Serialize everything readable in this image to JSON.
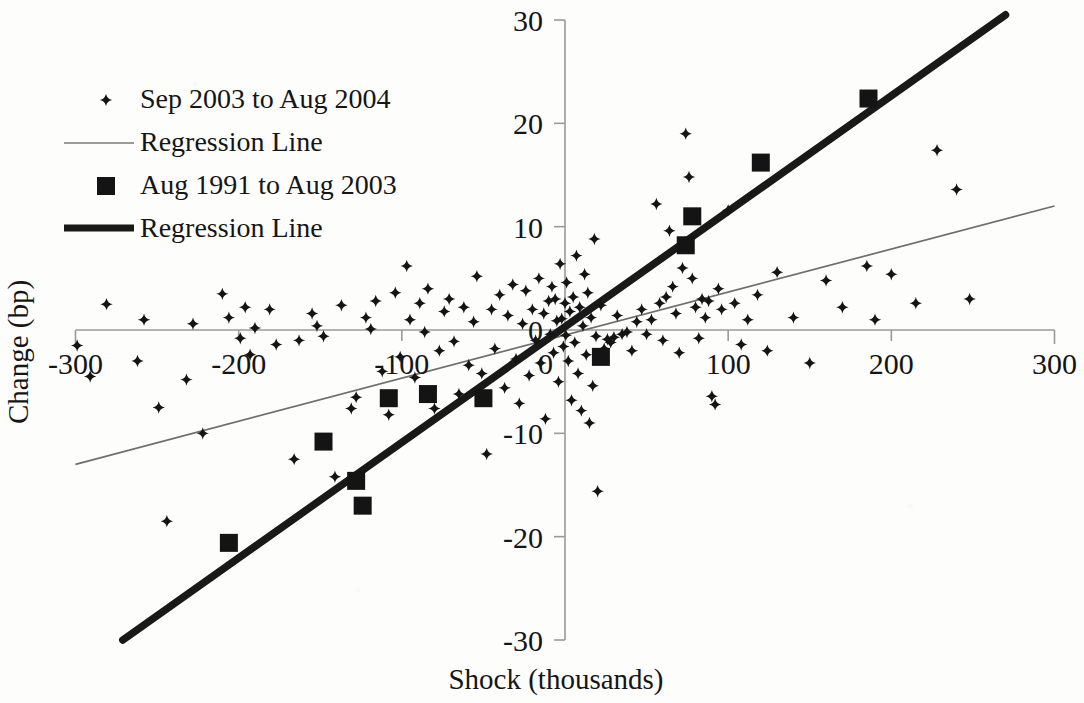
{
  "chart_data": {
    "type": "scatter",
    "title": "",
    "xlabel": "Shock (thousands)",
    "ylabel": "Change (bp)",
    "xlim": [
      -300,
      300
    ],
    "ylim": [
      -30,
      30
    ],
    "xticks": [
      -300,
      -200,
      -100,
      0,
      100,
      200,
      300
    ],
    "yticks": [
      -30,
      -20,
      -10,
      0,
      10,
      20,
      30
    ],
    "xtick_labels": [
      "-300",
      "-200",
      "-100",
      "0",
      "100",
      "200",
      "300"
    ],
    "ytick_labels": [
      "-30",
      "-20",
      "-10",
      "0",
      "10",
      "20",
      "30"
    ],
    "grid": false,
    "legend_position": "upper-left",
    "axis_style": "crossing-at-origin",
    "legend": [
      {
        "label": "Sep 2003 to Aug 2004",
        "marker": "small-cross",
        "kind": "points"
      },
      {
        "label": "Regression Line",
        "marker": "thin-line",
        "kind": "line"
      },
      {
        "label": "Aug 1991 to Aug 2003",
        "marker": "large-square",
        "kind": "points"
      },
      {
        "label": "Regression Line",
        "marker": "thick-line",
        "kind": "line"
      }
    ],
    "colors": {
      "marker": "#141414",
      "thin_line": "#6e6e6e",
      "thick_line": "#191919",
      "axis": "#9a9a9a",
      "background": "#fdfdfc"
    },
    "series": [
      {
        "name": "Sep 2003 to Aug 2004",
        "marker": "small-cross",
        "points": [
          [
            -299,
            -1.5
          ],
          [
            -291,
            -4.5
          ],
          [
            -281,
            2.5
          ],
          [
            -262,
            -3.0
          ],
          [
            -258,
            1.0
          ],
          [
            -249,
            -7.5
          ],
          [
            -244,
            -18.5
          ],
          [
            -232,
            -4.8
          ],
          [
            -228,
            0.6
          ],
          [
            -222,
            -10.0
          ],
          [
            -210,
            3.5
          ],
          [
            -206,
            1.2
          ],
          [
            -199,
            -0.8
          ],
          [
            -196,
            2.2
          ],
          [
            -193,
            -2.4
          ],
          [
            -190,
            0.2
          ],
          [
            -181,
            2.0
          ],
          [
            -177,
            -1.4
          ],
          [
            -166,
            -12.5
          ],
          [
            -163,
            -1.0
          ],
          [
            -155,
            1.6
          ],
          [
            -152,
            0.4
          ],
          [
            -148,
            -0.6
          ],
          [
            -141,
            -14.2
          ],
          [
            -137,
            2.4
          ],
          [
            -131,
            -7.6
          ],
          [
            -128,
            -6.5
          ],
          [
            -122,
            1.2
          ],
          [
            -119,
            0.1
          ],
          [
            -116,
            2.8
          ],
          [
            -112,
            -4.0
          ],
          [
            -108,
            -8.2
          ],
          [
            -104,
            3.6
          ],
          [
            -101,
            -2.6
          ],
          [
            -97,
            6.2
          ],
          [
            -95,
            1.0
          ],
          [
            -92,
            -4.6
          ],
          [
            -89,
            2.6
          ],
          [
            -86,
            -0.2
          ],
          [
            -84,
            4.0
          ],
          [
            -80,
            -7.6
          ],
          [
            -77,
            -2.0
          ],
          [
            -74,
            1.8
          ],
          [
            -71,
            3.0
          ],
          [
            -68,
            -1.1
          ],
          [
            -65,
            -6.2
          ],
          [
            -62,
            2.2
          ],
          [
            -59,
            -3.4
          ],
          [
            -56,
            0.8
          ],
          [
            -54,
            5.2
          ],
          [
            -51,
            -4.2
          ],
          [
            -48,
            -12.0
          ],
          [
            -45,
            2.0
          ],
          [
            -43,
            -1.8
          ],
          [
            -40,
            3.4
          ],
          [
            -37,
            -5.6
          ],
          [
            -35,
            1.4
          ],
          [
            -32,
            4.4
          ],
          [
            -30,
            -2.8
          ],
          [
            -28,
            -7.1
          ],
          [
            -26,
            0.6
          ],
          [
            -24,
            3.8
          ],
          [
            -22,
            -4.4
          ],
          [
            -20,
            2.0
          ],
          [
            -18,
            -1.0
          ],
          [
            -16,
            5.0
          ],
          [
            -15,
            -3.2
          ],
          [
            -13,
            1.6
          ],
          [
            -12,
            -8.6
          ],
          [
            -10,
            2.8
          ],
          [
            -9,
            -0.4
          ],
          [
            -8,
            4.2
          ],
          [
            -7,
            -2.2
          ],
          [
            -6,
            3.0
          ],
          [
            -5,
            0.9
          ],
          [
            -4,
            -5.0
          ],
          [
            -3,
            6.4
          ],
          [
            -2,
            1.1
          ],
          [
            -1,
            -1.6
          ],
          [
            0,
            2.6
          ],
          [
            0.5,
            -0.5
          ],
          [
            1,
            4.6
          ],
          [
            2,
            -3.0
          ],
          [
            3,
            1.8
          ],
          [
            4,
            -6.8
          ],
          [
            5,
            3.2
          ],
          [
            6,
            -1.2
          ],
          [
            7,
            7.2
          ],
          [
            8,
            -4.2
          ],
          [
            9,
            2.2
          ],
          [
            10,
            -7.8
          ],
          [
            11,
            0.4
          ],
          [
            12,
            5.4
          ],
          [
            13,
            -2.4
          ],
          [
            14,
            3.6
          ],
          [
            15,
            -9.0
          ],
          [
            16,
            1.2
          ],
          [
            17,
            -5.4
          ],
          [
            18,
            8.8
          ],
          [
            19,
            -0.6
          ],
          [
            20,
            -15.6
          ],
          [
            22,
            2.4
          ],
          [
            24,
            -1.8
          ],
          [
            26,
            -0.9
          ],
          [
            28,
            -1.2
          ],
          [
            30,
            -0.7
          ],
          [
            32,
            1.4
          ],
          [
            35,
            -0.4
          ],
          [
            38,
            -0.2
          ],
          [
            41,
            -2.0
          ],
          [
            44,
            0.8
          ],
          [
            47,
            2.0
          ],
          [
            50,
            -0.4
          ],
          [
            53,
            1.0
          ],
          [
            56,
            12.2
          ],
          [
            58,
            2.6
          ],
          [
            60,
            -1.0
          ],
          [
            62,
            3.2
          ],
          [
            64,
            9.6
          ],
          [
            66,
            4.2
          ],
          [
            68,
            1.6
          ],
          [
            70,
            -2.2
          ],
          [
            72,
            6.0
          ],
          [
            74,
            19.0
          ],
          [
            76,
            14.8
          ],
          [
            78,
            5.0
          ],
          [
            80,
            2.2
          ],
          [
            82,
            -0.8
          ],
          [
            84,
            3.0
          ],
          [
            86,
            1.2
          ],
          [
            88,
            2.8
          ],
          [
            90,
            -6.4
          ],
          [
            92,
            -7.2
          ],
          [
            94,
            4.0
          ],
          [
            96,
            2.0
          ],
          [
            100,
            11.6
          ],
          [
            104,
            2.6
          ],
          [
            108,
            -1.4
          ],
          [
            112,
            1.0
          ],
          [
            118,
            3.4
          ],
          [
            124,
            -2.0
          ],
          [
            130,
            5.6
          ],
          [
            140,
            1.2
          ],
          [
            150,
            -3.2
          ],
          [
            160,
            4.8
          ],
          [
            170,
            2.2
          ],
          [
            185,
            6.2
          ],
          [
            190,
            1.0
          ],
          [
            200,
            5.4
          ],
          [
            215,
            2.6
          ],
          [
            228,
            17.4
          ],
          [
            240,
            13.6
          ],
          [
            248,
            3.0
          ]
        ]
      },
      {
        "name": "Aug 1991 to Aug 2003",
        "marker": "large-square",
        "points": [
          [
            -206,
            -20.6
          ],
          [
            -148,
            -10.8
          ],
          [
            -128,
            -14.6
          ],
          [
            -124,
            -17.0
          ],
          [
            -108,
            -6.6
          ],
          [
            -84,
            -6.2
          ],
          [
            -50,
            -6.6
          ],
          [
            22,
            -2.6
          ],
          [
            74,
            8.2
          ],
          [
            78,
            11.0
          ],
          [
            120,
            16.2
          ],
          [
            186,
            22.4
          ]
        ]
      }
    ],
    "regression_lines": [
      {
        "name": "Regression Line",
        "series": "Sep 2003 to Aug 2004",
        "style": "thin",
        "x_start": -300,
        "y_start": -13.0,
        "x_end": 300,
        "y_end": 12.0,
        "slope": 0.0417,
        "intercept": -0.5
      },
      {
        "name": "Regression Line",
        "series": "Aug 1991 to Aug 2003",
        "style": "thick",
        "x_start": -271,
        "y_start": -30.0,
        "x_end": 270,
        "y_end": 30.5,
        "slope": 0.1119,
        "intercept": 0.3
      }
    ]
  }
}
